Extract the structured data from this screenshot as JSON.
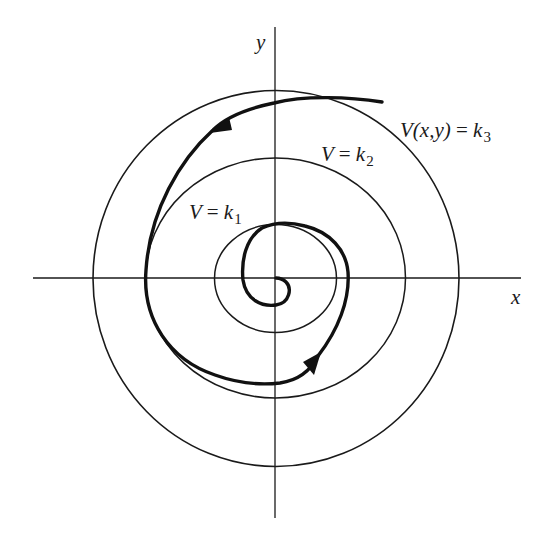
{
  "diagram": {
    "type": "phase-portrait-lyapunov-level-curves",
    "axes": {
      "x_label": "x",
      "y_label": "y",
      "origin": [
        276,
        278
      ],
      "x_axis_extent": [
        33,
        521
      ],
      "y_axis_extent": [
        27,
        518
      ]
    },
    "level_curves": [
      {
        "name": "k1",
        "label_lhs": "V",
        "label_op": "=",
        "label_k": "k",
        "label_sub": "1",
        "cx": 275.5,
        "cy": 278.5,
        "rx": 61,
        "ry": 54
      },
      {
        "name": "k2",
        "label_lhs": "V",
        "label_op": "=",
        "label_k": "k",
        "label_sub": "2",
        "cx": 275.5,
        "cy": 278,
        "rx": 130,
        "ry": 120
      },
      {
        "name": "k3",
        "label_lhs": "V(x,y)",
        "label_op": "=",
        "label_k": "k",
        "label_sub": "3",
        "cx": 276,
        "cy": 278.5,
        "rx": 183,
        "ry": 188
      }
    ],
    "trajectory": {
      "description": "Spiral trajectory moving inward toward the origin, crossing level curves V = k3 > k2 > k1",
      "direction": "clockwise-inward (counterclockwise in screen: leftward at top)",
      "start": [
        382,
        102
      ],
      "end": [
        276,
        278
      ],
      "arrows": [
        {
          "tip": [
            213,
            130
          ],
          "direction": "down-left"
        },
        {
          "tip": [
            318,
            355
          ],
          "direction": "up-right"
        }
      ]
    },
    "colors": {
      "line": "#1a1a1a",
      "background": "#ffffff"
    }
  }
}
